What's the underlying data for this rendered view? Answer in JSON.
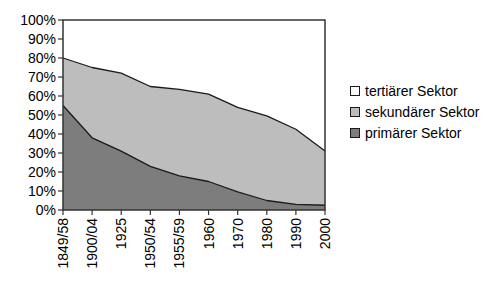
{
  "chart_data": {
    "type": "area",
    "stacked": true,
    "title": "",
    "xlabel": "",
    "ylabel": "",
    "ylim": [
      0,
      100
    ],
    "grid": false,
    "legend_position": "right",
    "y_tick_labels": [
      "100%",
      "90%",
      "80%",
      "70%",
      "60%",
      "50%",
      "40%",
      "30%",
      "20%",
      "10%",
      "0%"
    ],
    "categories": [
      "1849/58",
      "1900/04",
      "1925",
      "1950/54",
      "1955/59",
      "1960",
      "1970",
      "1980",
      "1990",
      "2000"
    ],
    "series": [
      {
        "name": "primärer Sektor",
        "color": "#7d7d7d",
        "values": [
          55,
          38,
          31,
          23,
          18,
          15,
          9.5,
          5,
          3,
          2.5
        ]
      },
      {
        "name": "sekundärer Sektor",
        "color": "#bdbdbd",
        "values": [
          25,
          37,
          41,
          42,
          45.5,
          46,
          44.5,
          44.5,
          39.5,
          28.5
        ]
      },
      {
        "name": "tertiärer Sektor",
        "color": "#ffffff",
        "values": [
          20,
          25,
          28,
          35,
          36.5,
          39,
          46,
          50.5,
          57.5,
          69
        ]
      }
    ],
    "legend_items": [
      {
        "label": "tertiärer Sektor",
        "color": "#ffffff"
      },
      {
        "label": "sekundärer Sektor",
        "color": "#bdbdbd"
      },
      {
        "label": "primärer Sektor",
        "color": "#7d7d7d"
      }
    ],
    "colors": {
      "border": "#333333",
      "boundary_line": "#1a1a1a",
      "tick": "#333333",
      "background": "#ffffff"
    }
  }
}
